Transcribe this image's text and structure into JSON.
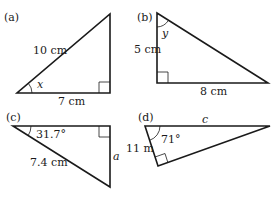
{
  "figure": {
    "panels": [
      {
        "id": "a",
        "label": "(a)",
        "hypotenuse": "10 cm",
        "base": "7 cm",
        "angle": "x"
      },
      {
        "id": "b",
        "label": "(b)",
        "vertical_side": "5 cm",
        "base": "8 cm",
        "angle": "y"
      },
      {
        "id": "c",
        "label": "(c)",
        "angle": "31.7°",
        "hypotenuse": "7.4 cm",
        "vertical_side": "a"
      },
      {
        "id": "d",
        "label": "(d)",
        "angle": "71°",
        "short_side": "11 m",
        "hypotenuse": "c"
      }
    ]
  }
}
